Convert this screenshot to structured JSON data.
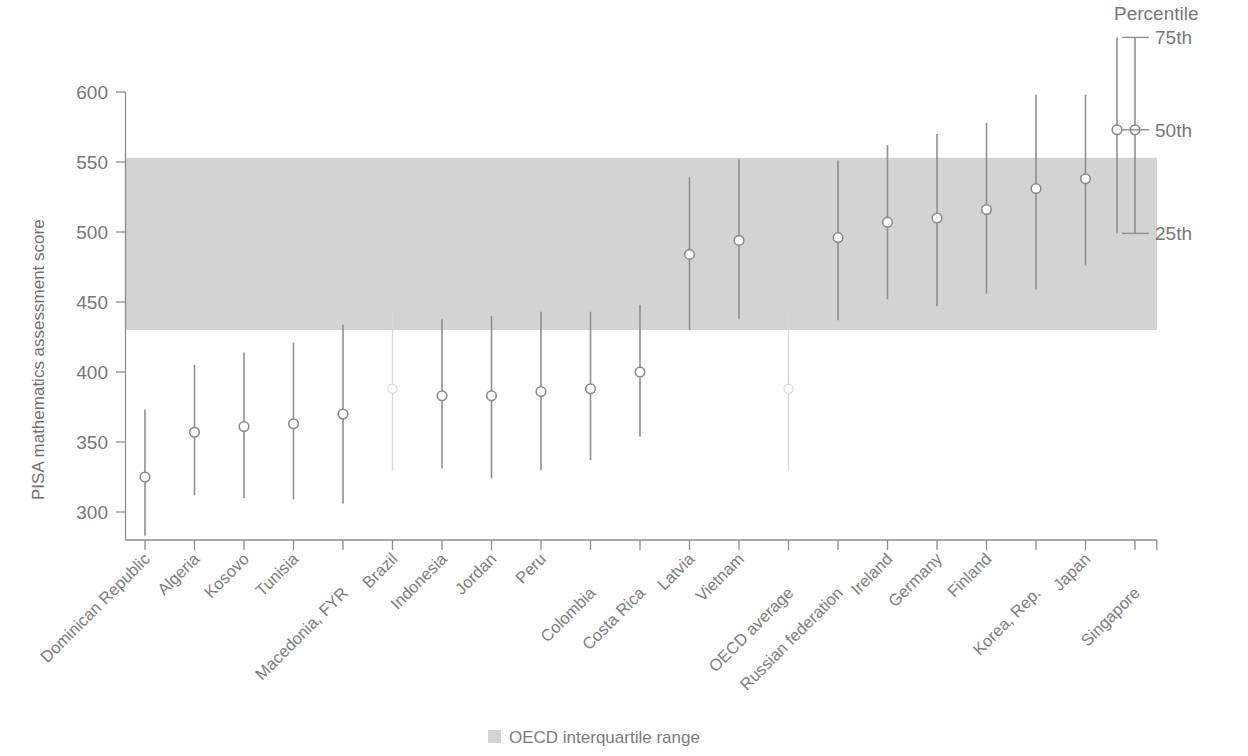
{
  "chart_data": {
    "type": "scatter",
    "title": "",
    "xlabel": "",
    "ylabel": "PISA mathematics assessment score",
    "ylim": [
      280,
      610
    ],
    "yticks": [
      300,
      350,
      400,
      450,
      500,
      550,
      600
    ],
    "ytick_labels": [
      "300",
      "350",
      "400",
      "450",
      "500",
      "550",
      "600"
    ],
    "grid": false,
    "legend_position": "bottom-center",
    "categories": [
      "Dominican Republic",
      "Algeria",
      "Kosovo",
      "Tunisia",
      "Macedonia, FYR",
      "Brazil",
      "Indonesia",
      "Jordan",
      "Peru",
      "Colombia",
      "Costa Rica",
      "Latvia",
      "Vietnam",
      "OECD average",
      "Russian federation",
      "Ireland",
      "Germany",
      "Finland",
      "Korea, Rep.",
      "Japan",
      "Singapore"
    ],
    "series": [
      {
        "name": "25th percentile",
        "values": [
          283,
          312,
          310,
          309,
          306,
          null,
          331,
          324,
          330,
          337,
          354,
          430,
          438,
          null,
          437,
          452,
          447,
          456,
          459,
          476,
          499
        ]
      },
      {
        "name": "50th percentile",
        "values": [
          325,
          357,
          361,
          363,
          370,
          null,
          383,
          383,
          386,
          388,
          400,
          484,
          494,
          null,
          496,
          507,
          510,
          516,
          531,
          538,
          573
        ]
      },
      {
        "name": "75th percentile",
        "values": [
          373,
          405,
          414,
          421,
          434,
          null,
          438,
          440,
          443,
          443,
          448,
          539,
          552,
          null,
          551,
          562,
          570,
          578,
          598,
          598,
          639
        ]
      }
    ],
    "band": {
      "label": "OECD interquartile range",
      "lower": 430,
      "upper": 553,
      "color": "#d3d3d3"
    },
    "notes": [
      "Brazil and OECD average columns render faintly / are not visible in the plot area."
    ]
  },
  "axis": {
    "y_title": "PISA mathematics assessment score"
  },
  "percentile_legend": {
    "title": "Percentile",
    "items": [
      {
        "label": "75th",
        "value": 639
      },
      {
        "label": "50th",
        "value": 573
      },
      {
        "label": "25th",
        "value": 499
      }
    ]
  },
  "bottom_legend": {
    "swatch_name": "iqr-swatch",
    "label": "OECD interquartile range"
  }
}
